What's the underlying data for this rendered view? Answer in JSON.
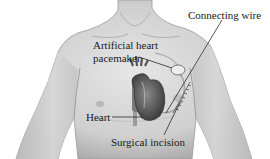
{
  "figure": {
    "labels": {
      "connecting_wire": "Connecting wire",
      "pacemaker_line1": "Artificial heart",
      "pacemaker_line2": "pacemaker",
      "heart": "Heart",
      "surgical_incision": "Surgical incision"
    }
  }
}
